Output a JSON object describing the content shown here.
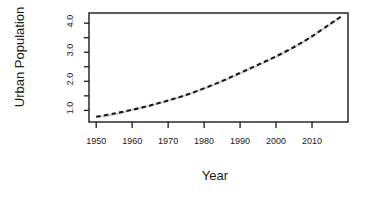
{
  "chart_data": {
    "type": "line",
    "title": "",
    "xlabel": "Year",
    "ylabel": "Urban Population",
    "xlim": [
      1948,
      2020
    ],
    "ylim": [
      0.6,
      4.35
    ],
    "grid": false,
    "legend": "none",
    "xticks": [
      1950,
      1960,
      1970,
      1980,
      1990,
      2000,
      2010
    ],
    "xtick_labels": [
      "1950",
      "1960",
      "1970",
      "1980",
      "1990",
      "2000",
      "2010"
    ],
    "xminor_ticks": [
      1950,
      1960,
      1970,
      1980,
      1990,
      2000,
      2010
    ],
    "yticks": [
      1.0,
      1.5,
      2.0,
      2.5,
      3.0,
      3.5,
      4.0
    ],
    "ytick_labels": [
      "1.0",
      "",
      "2.0",
      "",
      "3.0",
      "",
      "4.0"
    ],
    "ytick_labels_shown": [
      "1.0",
      "2.0",
      "3.0",
      "4.0"
    ],
    "series": [
      {
        "name": "observed",
        "style": "solid",
        "color": "#c8c8c8",
        "linewidth": 1.6,
        "x": [
          1950,
          1955,
          1960,
          1965,
          1970,
          1975,
          1980,
          1985,
          1990,
          1995,
          2000,
          2005,
          2010,
          2015,
          2018
        ],
        "values": [
          0.75,
          0.86,
          1.01,
          1.16,
          1.33,
          1.52,
          1.74,
          1.99,
          2.27,
          2.54,
          2.84,
          3.16,
          3.54,
          3.96,
          4.22
        ]
      },
      {
        "name": "fitted",
        "style": "dashed",
        "color": "#1a1a1a",
        "linewidth": 2.1,
        "x": [
          1950,
          1955,
          1960,
          1965,
          1970,
          1975,
          1980,
          1985,
          1990,
          1995,
          2000,
          2005,
          2010,
          2015,
          2018
        ],
        "values": [
          0.78,
          0.89,
          1.02,
          1.17,
          1.34,
          1.53,
          1.76,
          2.01,
          2.29,
          2.57,
          2.86,
          3.18,
          3.55,
          3.97,
          4.22
        ]
      }
    ]
  },
  "axes": {
    "x_title": "Year",
    "y_title": "Urban Population"
  }
}
